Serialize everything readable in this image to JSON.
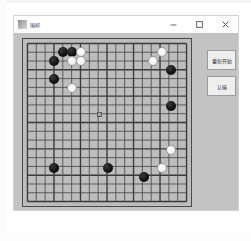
{
  "window": {
    "title": "围棋",
    "title_icon": "app-icon",
    "controls": {
      "minimize_label": "—",
      "maximize_label": "□",
      "close_label": "✕"
    }
  },
  "side_panel": {
    "restart_label": "重新开始",
    "resign_label": "认输"
  },
  "board": {
    "type": "go-board",
    "size": 19,
    "columns": 19,
    "rows": 19,
    "star_points": [
      {
        "col": 9,
        "row": 9
      }
    ],
    "colors": {
      "board_bg": "#bdbdbd",
      "grid_line": "#4f4f4f",
      "black_stone": "#111111",
      "white_stone": "#f5f5f5",
      "window_bg": "#c3c3c3",
      "titlebar_bg": "#ffffff",
      "button_bg": "#eeeeee"
    },
    "black_stone_count": 9,
    "white_stone_count": 9,
    "stones": [
      {
        "color": "black",
        "col": 5,
        "row": 2
      },
      {
        "color": "black",
        "col": 6,
        "row": 2
      },
      {
        "color": "white",
        "col": 7,
        "row": 2
      },
      {
        "color": "black",
        "col": 4,
        "row": 3
      },
      {
        "color": "white",
        "col": 6,
        "row": 3
      },
      {
        "color": "white",
        "col": 7,
        "row": 3
      },
      {
        "color": "black",
        "col": 4,
        "row": 5
      },
      {
        "color": "white",
        "col": 6,
        "row": 6
      },
      {
        "color": "white",
        "col": 16,
        "row": 2
      },
      {
        "color": "white",
        "col": 15,
        "row": 3
      },
      {
        "color": "black",
        "col": 17,
        "row": 4
      },
      {
        "color": "black",
        "col": 17,
        "row": 8
      },
      {
        "color": "white",
        "col": 17,
        "row": 13
      },
      {
        "color": "white",
        "col": 16,
        "row": 15
      },
      {
        "color": "black",
        "col": 14,
        "row": 16
      },
      {
        "color": "black",
        "col": 4,
        "row": 15
      },
      {
        "color": "black",
        "col": 10,
        "row": 15
      }
    ]
  }
}
